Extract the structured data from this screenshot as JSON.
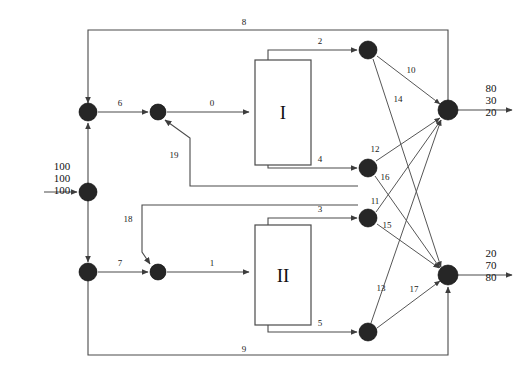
{
  "diagram": {
    "canvas": {
      "width": 525,
      "height": 373
    },
    "colors": {
      "pipe": "#4a4a4a",
      "node": "#262626",
      "text": "#111111",
      "background": "#ffffff"
    }
  },
  "units": [
    {
      "id": "unit-1",
      "label": "I",
      "x": 255,
      "y": 60,
      "w": 56,
      "h": 105
    },
    {
      "id": "unit-2",
      "label": "II",
      "x": 255,
      "y": 225,
      "w": 56,
      "h": 100
    }
  ],
  "nodes": [
    {
      "id": "n-split-top",
      "cx": 88,
      "cy": 112,
      "r": 9
    },
    {
      "id": "n-feed",
      "cx": 88,
      "cy": 192,
      "r": 9
    },
    {
      "id": "n-split-bottom",
      "cx": 88,
      "cy": 272,
      "r": 9
    },
    {
      "id": "n-mix-top",
      "cx": 158,
      "cy": 112,
      "r": 8
    },
    {
      "id": "n-mix-bottom",
      "cx": 158,
      "cy": 272,
      "r": 8
    },
    {
      "id": "n-split-2",
      "cx": 368,
      "cy": 50,
      "r": 9
    },
    {
      "id": "n-split-4",
      "cx": 368,
      "cy": 168,
      "r": 9
    },
    {
      "id": "n-split-3",
      "cx": 368,
      "cy": 218,
      "r": 9
    },
    {
      "id": "n-split-5",
      "cx": 368,
      "cy": 332,
      "r": 9
    },
    {
      "id": "n-product-top",
      "cx": 448,
      "cy": 110,
      "r": 10
    },
    {
      "id": "n-product-bottom",
      "cx": 448,
      "cy": 275,
      "r": 10
    }
  ],
  "stream_labels": [
    {
      "id": "s0",
      "text": "0",
      "x": 212,
      "y": 106
    },
    {
      "id": "s1",
      "text": "1",
      "x": 212,
      "y": 266
    },
    {
      "id": "s2",
      "text": "2",
      "x": 320,
      "y": 44
    },
    {
      "id": "s3",
      "text": "3",
      "x": 320,
      "y": 212
    },
    {
      "id": "s4",
      "text": "4",
      "x": 320,
      "y": 162
    },
    {
      "id": "s5",
      "text": "5",
      "x": 320,
      "y": 326
    },
    {
      "id": "s6",
      "text": "6",
      "x": 120,
      "y": 106
    },
    {
      "id": "s7",
      "text": "7",
      "x": 120,
      "y": 266
    },
    {
      "id": "s8",
      "text": "8",
      "x": 244,
      "y": 25
    },
    {
      "id": "s9",
      "text": "9",
      "x": 244,
      "y": 352
    },
    {
      "id": "s10",
      "text": "10",
      "x": 411,
      "y": 73
    },
    {
      "id": "s11",
      "text": "11",
      "x": 375,
      "y": 204
    },
    {
      "id": "s12",
      "text": "12",
      "x": 375,
      "y": 152
    },
    {
      "id": "s13",
      "text": "13",
      "x": 381,
      "y": 291
    },
    {
      "id": "s14",
      "text": "14",
      "x": 398,
      "y": 102
    },
    {
      "id": "s15",
      "text": "15",
      "x": 387,
      "y": 228
    },
    {
      "id": "s16",
      "text": "16",
      "x": 385,
      "y": 180
    },
    {
      "id": "s17",
      "text": "17",
      "x": 414,
      "y": 292
    },
    {
      "id": "s18",
      "text": "18",
      "x": 128,
      "y": 222
    },
    {
      "id": "s19",
      "text": "19",
      "x": 174,
      "y": 158
    }
  ],
  "feed": {
    "name": "feed-stream",
    "values": [
      "100",
      "100",
      "100"
    ],
    "x": 62,
    "y": 170
  },
  "products": [
    {
      "id": "product-top",
      "name": "top-product-stream",
      "values": [
        "80",
        "30",
        "20"
      ],
      "x": 483,
      "y": 92
    },
    {
      "id": "product-bottom",
      "name": "bottom-product-stream",
      "values": [
        "20",
        "70",
        "80"
      ],
      "x": 483,
      "y": 257
    }
  ]
}
